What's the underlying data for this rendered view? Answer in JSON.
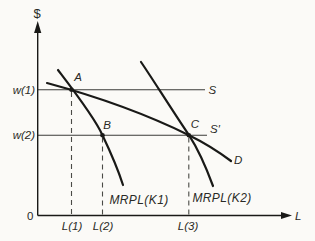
{
  "figure_type": "labor-market-mrpl-diagram",
  "colors": {
    "bg": "#fbfaf7",
    "ink": "#191917",
    "thin": "#3b3b38",
    "dashed": "#4a4a46",
    "text": "#2a2a26"
  },
  "labels": {
    "y_axis": "$",
    "x_axis": "L",
    "origin": "0",
    "w1": "w(1)",
    "w2": "w(2)",
    "l1": "L(1)",
    "l2": "L(2)",
    "l3": "L(3)",
    "point_a": "A",
    "point_b": "B",
    "point_c": "C",
    "supply": "S",
    "supply_prime": "S′",
    "demand": "D",
    "mrpl_k1": "MRPL(K1)",
    "mrpl_k2": "MRPL(K2)"
  },
  "curves": {
    "mrpl_k1": {
      "label": "MRPL(K1)",
      "path": "M 58 70 C 74 91 95 118 102.5 135.3 C 109.5 150 117.5 168 123 185"
    },
    "mrpl_k2": {
      "label": "MRPL(K2)",
      "path": "M 141 62 C 152 78 170 107 189 135.2 C 196 146 206.5 168.5 213 186"
    },
    "demand": {
      "label": "D",
      "path": "M 47 83 C 95 96 145 113.5 189 135.2 C 204 142.5 219 152 231 161"
    }
  },
  "points": {
    "a": {
      "label": "A",
      "x": 71.5,
      "y": 89.8
    },
    "b": {
      "label": "B",
      "x": 102.5,
      "y": 135.2
    },
    "c": {
      "label": "C",
      "x": 188.8,
      "y": 135.2
    }
  }
}
